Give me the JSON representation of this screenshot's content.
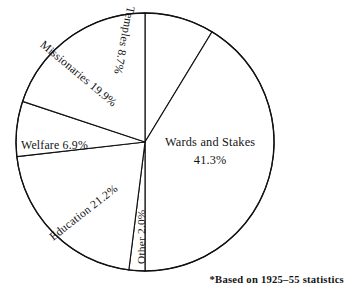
{
  "chart_data": {
    "type": "pie",
    "title": "",
    "subtitle": "",
    "xlabel": "",
    "ylabel": "",
    "legend_position": "none",
    "grid": false,
    "labels_inside": true,
    "start_angle_deg": 0,
    "direction": "clockwise",
    "center": {
      "x": 145,
      "y": 142
    },
    "radius": 129,
    "unit": "%",
    "total": 100.0,
    "categories": [
      "Temples",
      "Wards and Stakes",
      "Other",
      "Education",
      "Welfare",
      "Missionaries"
    ],
    "values": [
      8.7,
      41.3,
      2.0,
      21.2,
      6.9,
      19.9
    ],
    "slices": [
      {
        "name": "Temples",
        "label": "Temples",
        "value": 8.7,
        "value_text": "8.7%",
        "label_text": "Temples 8.7%",
        "rotation_deg": 101
      },
      {
        "name": "Wards and Stakes",
        "label": "Wards and Stakes",
        "value": 41.3,
        "value_text": "41.3%",
        "label_text": "Wards and Stakes 41.3%",
        "label_line_1": "Wards and Stakes",
        "label_line_2": "41.3%",
        "rotation_deg": 0
      },
      {
        "name": "Other",
        "label": "Other",
        "value": 2.0,
        "value_text": "2.0%",
        "label_text": "Other 2.0%",
        "rotation_deg": -90
      },
      {
        "name": "Education",
        "label": "Education",
        "value": 21.2,
        "value_text": "21.2%",
        "label_text": "Education 21.2%",
        "rotation_deg": -38
      },
      {
        "name": "Welfare",
        "label": "Welfare",
        "value": 6.9,
        "value_text": "6.9%",
        "label_text": "Welfare 6.9%",
        "rotation_deg": 0
      },
      {
        "name": "Missionaries",
        "label": "Missionaries",
        "value": 19.9,
        "value_text": "19.9%",
        "label_text": "Missionaries 19.9%",
        "rotation_deg": 40
      }
    ],
    "annotations": [
      {
        "name": "footnote",
        "text": "*Based on 1925–55 statistics"
      }
    ],
    "colors": {
      "slice_fill": "#ffffff",
      "slice_stroke": "#111111",
      "text": "#141414",
      "background": "#ffffff"
    }
  },
  "footnote": {
    "text": "*Based on 1925–55 statistics"
  }
}
